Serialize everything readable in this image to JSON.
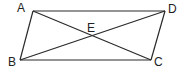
{
  "diagram": {
    "type": "parallelogram-with-diagonals",
    "stroke_color": "#2a2a2a",
    "points": {
      "A": {
        "label": "A",
        "x": 33,
        "y": 11,
        "lx": 17,
        "ly": 12
      },
      "D": {
        "label": "D",
        "x": 165,
        "y": 11,
        "lx": 168,
        "ly": 13
      },
      "B": {
        "label": "B",
        "x": 20,
        "y": 60,
        "lx": 8,
        "ly": 66
      },
      "C": {
        "label": "C",
        "x": 151,
        "y": 60,
        "lx": 154,
        "ly": 66
      },
      "E": {
        "label": "E",
        "x": 92,
        "y": 36,
        "lx": 87,
        "ly": 32
      }
    },
    "edges": [
      [
        "A",
        "D"
      ],
      [
        "D",
        "C"
      ],
      [
        "C",
        "B"
      ],
      [
        "B",
        "A"
      ]
    ],
    "diagonals": [
      [
        "A",
        "C"
      ],
      [
        "B",
        "D"
      ]
    ]
  }
}
